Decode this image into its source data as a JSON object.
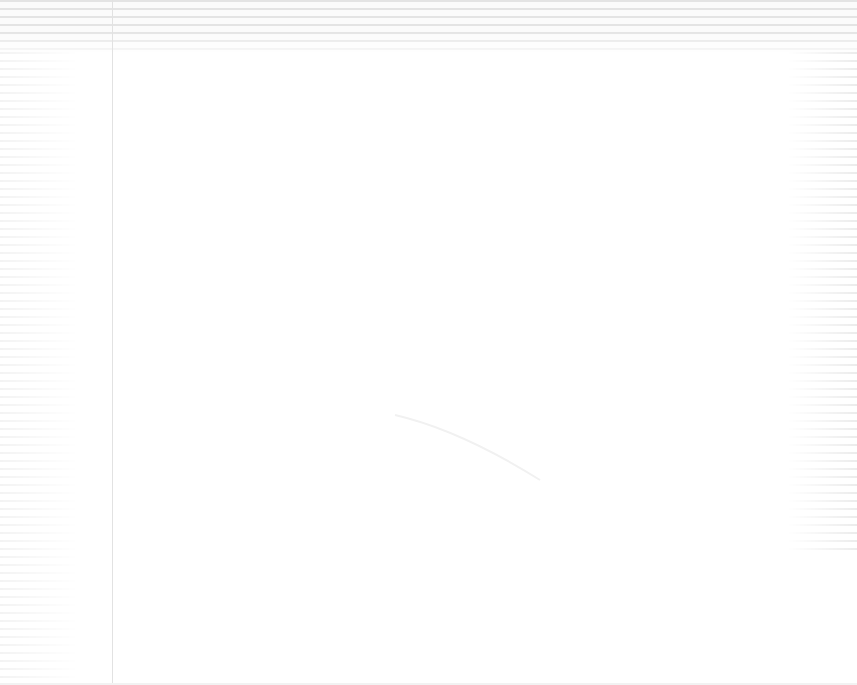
{
  "window": {
    "title": ""
  },
  "toolbar": {
    "rows": 6
  },
  "sidebar": {
    "items": []
  },
  "main": {
    "content": ""
  },
  "colors": {
    "stripe": "#e4e4e4",
    "background": "#ffffff",
    "divider": "#e2e2e2"
  }
}
